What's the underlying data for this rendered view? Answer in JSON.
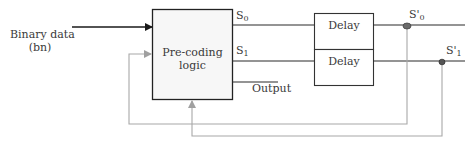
{
  "diagram": {
    "input_label_line1": "Binary data",
    "input_label_line2": "(bn)",
    "precoding_block": {
      "line1": "Pre-coding",
      "line2": "logic"
    },
    "signals": {
      "s0": "S",
      "s0_sub": "0",
      "s1": "S",
      "s1_sub": "1",
      "output": "Output",
      "s0_prime": "S'",
      "s0_prime_sub": "0",
      "s1_prime": "S'",
      "s1_prime_sub": "1"
    },
    "delay_blocks": [
      {
        "label": "Delay"
      },
      {
        "label": "Delay"
      }
    ],
    "colors": {
      "line": "#2a2a2a",
      "feedback": "#a8a8a8",
      "node": "#6a6a6a",
      "block_fill": "#f7f7f7"
    }
  }
}
